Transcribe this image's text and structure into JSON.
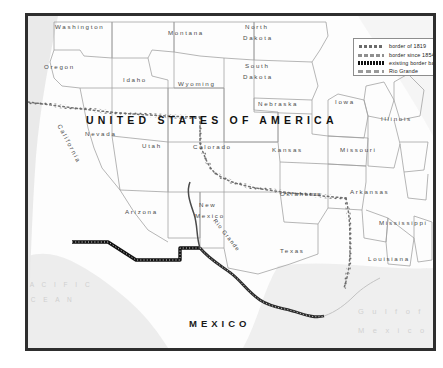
{
  "map": {
    "title": "US–Mexico border map",
    "country_labels": [
      {
        "name": "united-states",
        "text": "UNITED STATES OF AMERICA",
        "x": 86,
        "y": 114
      },
      {
        "name": "mexico",
        "text": "MEXICO",
        "x": 189,
        "y": 318
      }
    ],
    "ocean_labels": [
      {
        "name": "pacific-ocean-line1",
        "text": "P A C I F I C",
        "x": 18,
        "y": 281
      },
      {
        "name": "pacific-ocean-line2",
        "text": "O C E A N",
        "x": 18,
        "y": 296
      },
      {
        "name": "gulf-of-mexico-line1",
        "text": "G u l f   o f",
        "x": 358,
        "y": 307
      },
      {
        "name": "gulf-of-mexico-line2",
        "text": "M e x i c o",
        "x": 358,
        "y": 326
      }
    ],
    "river_labels": [
      {
        "name": "rio-grande-river-label",
        "text": "Rio Grande",
        "x": 207,
        "y": 232,
        "rotate": 52
      }
    ],
    "states": [
      {
        "name": "washington",
        "text": "Washington",
        "x": 55,
        "y": 23
      },
      {
        "name": "oregon",
        "text": "Oregon",
        "x": 44,
        "y": 63
      },
      {
        "name": "idaho",
        "text": "Idaho",
        "x": 123,
        "y": 76
      },
      {
        "name": "montana",
        "text": "Montana",
        "x": 168,
        "y": 29
      },
      {
        "name": "north-dakota-1",
        "text": "North",
        "x": 245,
        "y": 23
      },
      {
        "name": "north-dakota-2",
        "text": "Dakota",
        "x": 243,
        "y": 34
      },
      {
        "name": "south-dakota-1",
        "text": "South",
        "x": 245,
        "y": 62
      },
      {
        "name": "south-dakota-2",
        "text": "Dakota",
        "x": 243,
        "y": 73
      },
      {
        "name": "wyoming",
        "text": "Wyoming",
        "x": 178,
        "y": 80
      },
      {
        "name": "nevada",
        "text": "Nevada",
        "x": 85,
        "y": 130
      },
      {
        "name": "utah",
        "text": "Utah",
        "x": 142,
        "y": 142
      },
      {
        "name": "california",
        "text": "California",
        "x": 48,
        "y": 140,
        "rotate": 62
      },
      {
        "name": "colorado",
        "text": "Colorado",
        "x": 193,
        "y": 143
      },
      {
        "name": "arizona",
        "text": "Arizona",
        "x": 125,
        "y": 208
      },
      {
        "name": "new-mexico-1",
        "text": "New",
        "x": 199,
        "y": 201
      },
      {
        "name": "new-mexico-2",
        "text": "Mexico",
        "x": 195,
        "y": 212
      },
      {
        "name": "nebraska",
        "text": "Nebraska",
        "x": 258,
        "y": 100
      },
      {
        "name": "kansas",
        "text": "Kansas",
        "x": 272,
        "y": 146
      },
      {
        "name": "oklahoma",
        "text": "Oklahoma",
        "x": 280,
        "y": 190
      },
      {
        "name": "texas",
        "text": "Texas",
        "x": 280,
        "y": 247
      },
      {
        "name": "iowa",
        "text": "Iowa",
        "x": 335,
        "y": 98
      },
      {
        "name": "missouri",
        "text": "Missouri",
        "x": 340,
        "y": 146
      },
      {
        "name": "illinois",
        "text": "Illinois",
        "x": 381,
        "y": 115
      },
      {
        "name": "arkansas",
        "text": "Arkansas",
        "x": 350,
        "y": 188
      },
      {
        "name": "mississippi",
        "text": "Mississippi",
        "x": 379,
        "y": 219
      },
      {
        "name": "louisiana",
        "text": "Louisiana",
        "x": 368,
        "y": 255
      }
    ]
  },
  "legend": {
    "items": [
      {
        "name": "legend-border-1819",
        "key": "dotted",
        "label": "border of 1819"
      },
      {
        "name": "legend-border-1854",
        "key": "dashed",
        "label": "border since 1854"
      },
      {
        "name": "legend-border-barrier",
        "key": "barrier",
        "label": "existing border barrier"
      },
      {
        "name": "legend-rio-grande",
        "key": "river",
        "label": "Rio Grande"
      }
    ]
  },
  "colors": {
    "frame": "#2e2e2e",
    "land": "#ffffff",
    "sea": "#e9e9e9",
    "state_line": "#9a9a9a",
    "barrier": "#111111",
    "dotted_border": "#6b6b6b"
  }
}
